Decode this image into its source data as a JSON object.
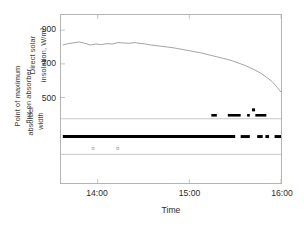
{
  "chart_data": {
    "type": "line",
    "title": "",
    "subtitle": "",
    "xlabel": "Time",
    "ylabel_top": "Direct solar insolation, W/m²",
    "ylabel_outer_line1": "Point of maximum",
    "ylabel_outer_line2": "flux on absorber",
    "ylabel_inner_line1": "absorber",
    "ylabel_inner_line2": "width",
    "grid": false,
    "legend": "none",
    "x_axis": {
      "label": "Time",
      "tick_labels": [
        "14:00",
        "15:00",
        "16:00"
      ],
      "tick_values": [
        14.0,
        15.0,
        16.0
      ],
      "min": 13.6,
      "max": 16.0
    },
    "y_axis_top": {
      "label": "Direct solar insolation, W/m²",
      "tick_labels": [
        "900",
        "700",
        "500"
      ],
      "tick_values": [
        900,
        700,
        500
      ],
      "min": 380,
      "max": 990,
      "units": "W/m²"
    },
    "absorber_band": {
      "upper_bound_label": "absorber width upper edge",
      "lower_bound_label": "absorber width lower edge",
      "center_label": "point of maximum flux"
    },
    "series": [
      {
        "name": "Direct solar insolation",
        "type": "line",
        "color": "#8a8a8a",
        "x": [
          13.62,
          13.68,
          13.74,
          13.8,
          13.86,
          13.92,
          13.98,
          14.04,
          14.1,
          14.16,
          14.22,
          14.28,
          14.34,
          14.4,
          14.46,
          14.52,
          14.58,
          14.64,
          14.7,
          14.76,
          14.82,
          14.88,
          14.94,
          15.0,
          15.06,
          15.12,
          15.18,
          15.24,
          15.3,
          15.36,
          15.42,
          15.48,
          15.54,
          15.6,
          15.66,
          15.72,
          15.78,
          15.84,
          15.9,
          15.96,
          16.0
        ],
        "y": [
          812,
          820,
          825,
          830,
          822,
          812,
          818,
          814,
          820,
          818,
          826,
          824,
          822,
          826,
          822,
          818,
          812,
          808,
          804,
          800,
          796,
          790,
          784,
          778,
          772,
          766,
          758,
          750,
          742,
          734,
          726,
          716,
          704,
          692,
          678,
          662,
          644,
          622,
          596,
          560,
          532
        ]
      },
      {
        "name": "Point of maximum flux on absorber",
        "type": "scatter",
        "color": "#000000",
        "note": "dense band of markers at absorber centre plus scattered markers above band",
        "center_segments": [
          [
            13.62,
            15.5
          ],
          [
            15.56,
            15.66
          ],
          [
            15.74,
            15.8
          ],
          [
            15.83,
            15.87
          ],
          [
            15.93,
            16.0
          ]
        ],
        "upper_segments": [
          [
            15.24,
            15.3
          ],
          [
            15.42,
            15.56
          ],
          [
            15.63,
            15.66
          ],
          [
            15.72,
            15.84
          ]
        ],
        "outlier_points": [
          {
            "x": 15.7,
            "y": 427
          }
        ],
        "faint_points": [
          {
            "x": 13.95,
            "y_band": "below"
          },
          {
            "x": 14.22,
            "y_band": "below"
          }
        ]
      }
    ]
  },
  "colors": {
    "line": "#8a8a8a",
    "marker": "#000000",
    "axis": "#b4b4b4",
    "band_guide": "#c0c0c0",
    "text": "#2b2b2b"
  }
}
